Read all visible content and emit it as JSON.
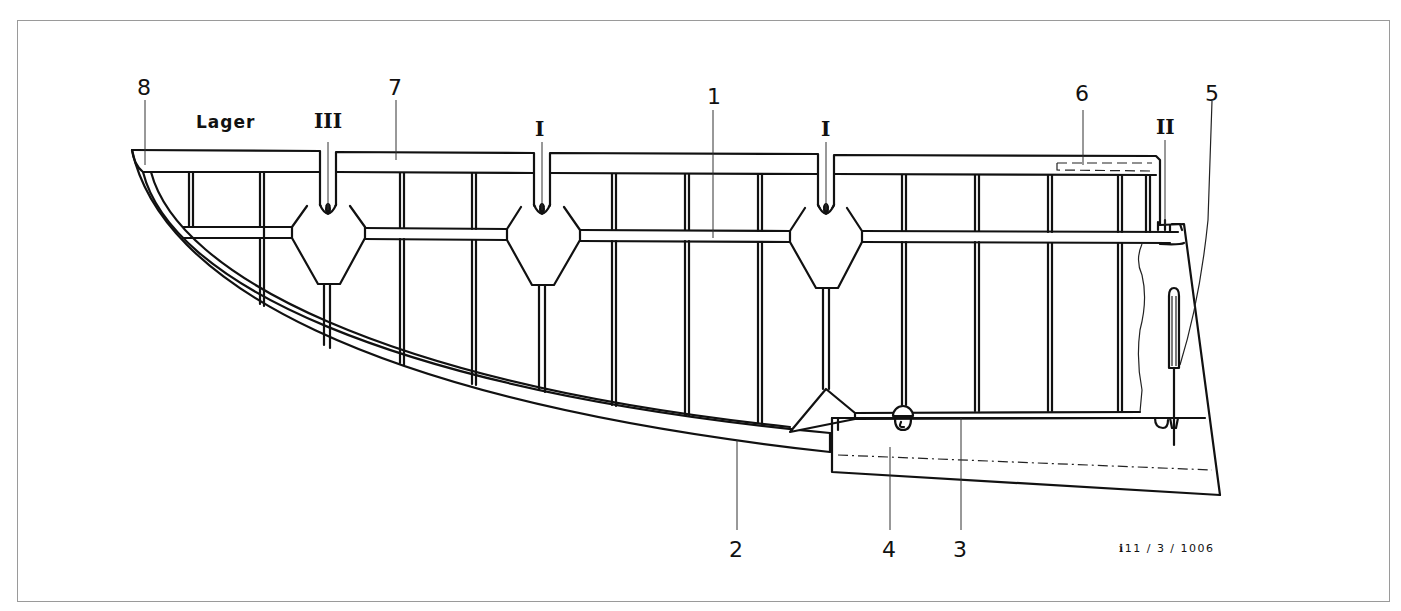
{
  "diagram": {
    "reference_code": "ℹ11 / 3 / 1006",
    "labels": {
      "part_8": "8",
      "bearing": "Lager",
      "hinge_III": "III",
      "part_7": "7",
      "hinge_I_left": "I",
      "part_1": "1",
      "hinge_I_right": "I",
      "part_6": "6",
      "hinge_II": "II",
      "part_5": "5",
      "part_2": "2",
      "part_4": "4",
      "part_3": "3"
    },
    "callouts": [
      {
        "id": "8",
        "x": 145,
        "y": 85
      },
      {
        "id": "Lager",
        "x": 228,
        "y": 122
      },
      {
        "id": "III",
        "x": 328,
        "y": 120
      },
      {
        "id": "7",
        "x": 396,
        "y": 85
      },
      {
        "id": "I",
        "x": 540,
        "y": 130
      },
      {
        "id": "1",
        "x": 713,
        "y": 100
      },
      {
        "id": "I",
        "x": 828,
        "y": 130
      },
      {
        "id": "6",
        "x": 1083,
        "y": 97
      },
      {
        "id": "II",
        "x": 1165,
        "y": 128
      },
      {
        "id": "5",
        "x": 1213,
        "y": 97
      },
      {
        "id": "2",
        "x": 737,
        "y": 552
      },
      {
        "id": "4",
        "x": 890,
        "y": 552
      },
      {
        "id": "3",
        "x": 961,
        "y": 552
      }
    ],
    "colors": {
      "ink": "#111111",
      "background": "#ffffff",
      "frame": "#9a9a9a"
    }
  }
}
